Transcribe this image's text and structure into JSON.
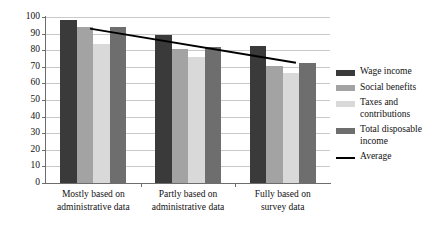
{
  "chart_data": {
    "type": "bar",
    "title": "",
    "xlabel": "",
    "ylabel": "",
    "ylim": [
      0,
      100
    ],
    "ytick_step": 10,
    "grid": true,
    "legend_position": "right",
    "categories": [
      "Mostly based on administrative data",
      "Partly based on administrative data",
      "Fully based on survey data"
    ],
    "category_lines": [
      [
        "Mostly based on",
        "administrative data"
      ],
      [
        "Partly based on",
        "administrative data"
      ],
      [
        "Fully based on",
        "survey data"
      ]
    ],
    "yticks": [
      0,
      10,
      20,
      30,
      40,
      50,
      60,
      70,
      80,
      90,
      100
    ],
    "series": [
      {
        "name": "Wage income",
        "color": "#3a3a3a",
        "values": [
          98,
          89,
          82.5
        ]
      },
      {
        "name": "Social benefits",
        "color": "#a3a3a3",
        "values": [
          94,
          81,
          70.5
        ]
      },
      {
        "name": "Taxes and contributions",
        "color": "#d9d9d9",
        "values": [
          83.5,
          76,
          66.5
        ]
      },
      {
        "name": "Total disposable income",
        "color": "#6e6e6e",
        "values": [
          94,
          82,
          72.5
        ]
      }
    ],
    "overlay_line": {
      "name": "Average",
      "color": "#000000",
      "x_start_pct": 15.5,
      "x_end_pct": 88.0,
      "y_start": 93,
      "y_end": 72.5
    },
    "legend_entries": [
      {
        "label": "Wage income",
        "type": "swatch",
        "color": "#3a3a3a"
      },
      {
        "label": "Social benefits",
        "type": "swatch",
        "color": "#a3a3a3"
      },
      {
        "label": "Taxes and contributions",
        "type": "swatch",
        "color": "#d9d9d9"
      },
      {
        "label": "Total disposable income",
        "type": "swatch",
        "color": "#6e6e6e"
      },
      {
        "label": "Average",
        "type": "line",
        "color": "#000000"
      }
    ]
  }
}
